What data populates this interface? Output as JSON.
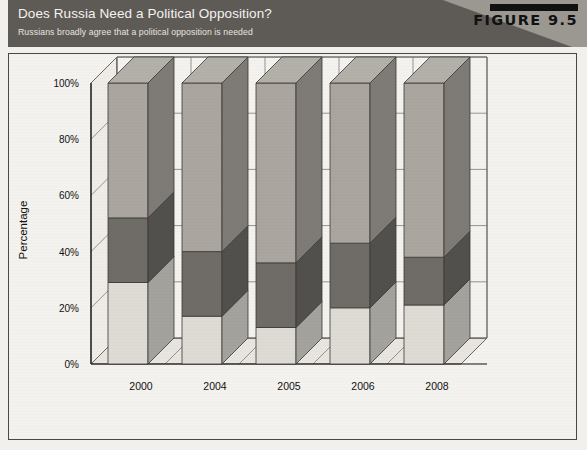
{
  "header": {
    "title": "Does Russia Need a Political Opposition?",
    "subtitle": "Russians broadly agree that a political opposition is needed",
    "figure_label": "FIGURE 9.5"
  },
  "colors": {
    "header_bg": "#5e5b57",
    "header_accent": "#9b9892",
    "page_bg": "#f2f0ec",
    "frame_bg": "#f4f2ee",
    "no": "#dedbd4",
    "hard_to_say": "#6f6c68",
    "yes": "#aaa69f",
    "axis": "#111111"
  },
  "legend": {
    "position": "bottom-center",
    "items": [
      {
        "label": "No",
        "color": "#dedbd4"
      },
      {
        "label": "Hard to say",
        "color": "#6f6c68"
      },
      {
        "label": "Yes",
        "color": "#aaa69f"
      }
    ]
  },
  "chart_data": {
    "type": "bar",
    "stacked": true,
    "style": "3d-stacked-column",
    "title": "Does Russia Need a Political Opposition?",
    "subtitle": "Russians broadly agree that a political opposition is needed",
    "xlabel": "",
    "ylabel": "Percentage",
    "categories": [
      "2000",
      "2004",
      "2005",
      "2006",
      "2008"
    ],
    "ylim": [
      0,
      100
    ],
    "yticks": [
      "0%",
      "20%",
      "40%",
      "60%",
      "80%",
      "100%"
    ],
    "ytick_values": [
      0,
      20,
      40,
      60,
      80,
      100
    ],
    "grid": true,
    "series": [
      {
        "name": "No",
        "color": "#dedbd4",
        "values": [
          29,
          17,
          13,
          20,
          21
        ]
      },
      {
        "name": "Hard to say",
        "color": "#6f6c68",
        "values": [
          23,
          23,
          23,
          23,
          17
        ]
      },
      {
        "name": "Yes",
        "color": "#aaa69f",
        "values": [
          48,
          60,
          64,
          57,
          62
        ]
      }
    ],
    "stack_order": [
      "No",
      "Hard to say",
      "Yes"
    ]
  }
}
